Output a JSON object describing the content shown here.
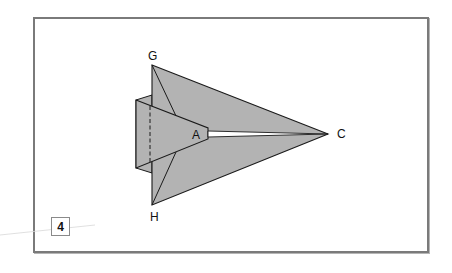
{
  "diagram": {
    "type": "origami-paper-airplane-step",
    "step_number": "4",
    "colors": {
      "frame_border": "#7a7a7a",
      "paper_fill": "#b3b3b3",
      "paper_stroke": "#1a1a1a",
      "slit": "#ffffff",
      "background": "#ffffff"
    },
    "points": {
      "G": {
        "label": "G",
        "x": 152,
        "y": 65
      },
      "H": {
        "label": "H",
        "x": 152,
        "y": 205
      },
      "A": {
        "label": "A",
        "x": 208,
        "y": 134
      },
      "C": {
        "label": "C",
        "x": 328,
        "y": 134
      }
    },
    "labels": {
      "G": "G",
      "H": "H",
      "A": "A",
      "C": "C"
    },
    "elements": [
      "outer flap triangle G-C-H",
      "inner flap triangle with tip at A",
      "rear rectangular panel with dashed fold line",
      "white slit from A to C",
      "diagonal creases from G and H"
    ]
  }
}
